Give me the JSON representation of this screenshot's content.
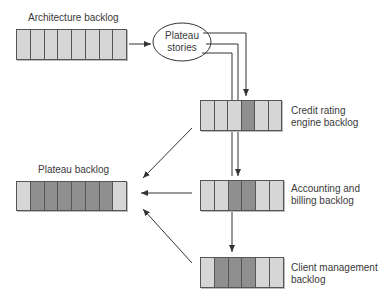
{
  "diagram": {
    "title_labels": {
      "architecture_backlog": "Architecture backlog",
      "plateau_stories": [
        "Plateau",
        "stories"
      ],
      "credit_rating": [
        "Credit rating",
        "engine backlog"
      ],
      "accounting": [
        "Accounting and",
        "billing backlog"
      ],
      "client_management": [
        "Client management",
        "backlog"
      ],
      "plateau_backlog": "Plateau backlog"
    },
    "backlogs": {
      "architecture": [
        "light",
        "light",
        "light",
        "light",
        "light",
        "light",
        "light",
        "light"
      ],
      "credit_rating": [
        "light",
        "light",
        "light",
        "dark",
        "light",
        "light"
      ],
      "accounting": [
        "light",
        "light",
        "dark",
        "dark",
        "light",
        "light"
      ],
      "client_management": [
        "light",
        "dark",
        "dark",
        "dark",
        "light",
        "light"
      ],
      "plateau": [
        "light",
        "dark",
        "dark",
        "dark",
        "dark",
        "dark",
        "dark",
        "light"
      ]
    },
    "colors": {
      "light": "#d6d6d6",
      "dark": "#8f8f8f",
      "line": "#333333"
    }
  }
}
